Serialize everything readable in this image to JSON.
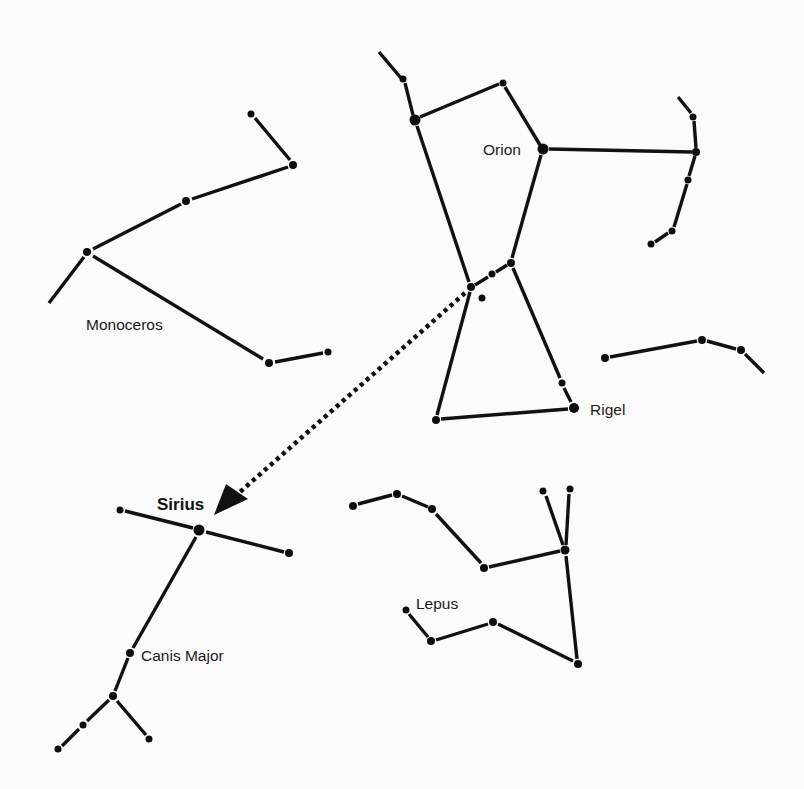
{
  "diagram": {
    "type": "star-chart",
    "background": "#fbfbfb",
    "line_color": "#111111"
  },
  "labels": {
    "orion": "Orion",
    "rigel": "Rigel",
    "monoceros": "Monoceros",
    "sirius": "Sirius",
    "canis_major": "Canis Major",
    "lepus": "Lepus"
  },
  "constellations": [
    {
      "name": "Orion",
      "stars": [
        {
          "x": 415,
          "y": 120,
          "r": 5.5
        },
        {
          "x": 403,
          "y": 79,
          "r": 3.5
        },
        {
          "x": 503,
          "y": 83,
          "r": 3.5
        },
        {
          "x": 543,
          "y": 149,
          "r": 5.5
        },
        {
          "x": 696,
          "y": 152,
          "r": 4
        },
        {
          "x": 693,
          "y": 117,
          "r": 3.5
        },
        {
          "x": 688,
          "y": 180,
          "r": 3.5
        },
        {
          "x": 672,
          "y": 231,
          "r": 3.5
        },
        {
          "x": 651,
          "y": 244,
          "r": 3.5
        },
        {
          "x": 471,
          "y": 287,
          "r": 4
        },
        {
          "x": 492,
          "y": 274,
          "r": 3.5
        },
        {
          "x": 511,
          "y": 263,
          "r": 4
        },
        {
          "x": 482,
          "y": 298,
          "r": 3.5
        },
        {
          "x": 436,
          "y": 420,
          "r": 4
        },
        {
          "x": 562,
          "y": 383,
          "r": 3.5
        },
        {
          "x": 574,
          "y": 408,
          "r": 5
        }
      ]
    },
    {
      "name": "Monoceros",
      "stars": [
        {
          "x": 251,
          "y": 114,
          "r": 3.5
        },
        {
          "x": 293,
          "y": 165,
          "r": 4
        },
        {
          "x": 186,
          "y": 201,
          "r": 4
        },
        {
          "x": 87,
          "y": 252,
          "r": 4
        },
        {
          "x": 269,
          "y": 363,
          "r": 4
        },
        {
          "x": 328,
          "y": 352,
          "r": 3.5
        }
      ]
    },
    {
      "name": "Eridanus-fragment",
      "stars": [
        {
          "x": 605,
          "y": 358,
          "r": 4
        },
        {
          "x": 702,
          "y": 340,
          "r": 4
        },
        {
          "x": 741,
          "y": 350,
          "r": 4
        }
      ]
    },
    {
      "name": "Canis Major",
      "stars": [
        {
          "x": 120,
          "y": 510,
          "r": 3.5
        },
        {
          "x": 199,
          "y": 530,
          "r": 5.5
        },
        {
          "x": 289,
          "y": 553,
          "r": 4
        },
        {
          "x": 130,
          "y": 653,
          "r": 4
        },
        {
          "x": 113,
          "y": 696,
          "r": 4
        },
        {
          "x": 83,
          "y": 725,
          "r": 3.5
        },
        {
          "x": 149,
          "y": 739,
          "r": 3.5
        },
        {
          "x": 58,
          "y": 749,
          "r": 3.5
        }
      ]
    },
    {
      "name": "Lepus",
      "stars": [
        {
          "x": 353,
          "y": 506,
          "r": 4
        },
        {
          "x": 397,
          "y": 494,
          "r": 4
        },
        {
          "x": 432,
          "y": 509,
          "r": 4
        },
        {
          "x": 484,
          "y": 568,
          "r": 4
        },
        {
          "x": 565,
          "y": 550,
          "r": 4.5
        },
        {
          "x": 543,
          "y": 491,
          "r": 3.5
        },
        {
          "x": 570,
          "y": 489,
          "r": 3.5
        },
        {
          "x": 578,
          "y": 664,
          "r": 4
        },
        {
          "x": 493,
          "y": 622,
          "r": 4
        },
        {
          "x": 431,
          "y": 641,
          "r": 4
        },
        {
          "x": 406,
          "y": 610,
          "r": 3.5
        }
      ]
    }
  ],
  "pointer": {
    "from": {
      "x": 468,
      "y": 290
    },
    "to": {
      "x": 216,
      "y": 514
    },
    "style": "dotted",
    "meaning": "Orion's belt points to Sirius"
  }
}
